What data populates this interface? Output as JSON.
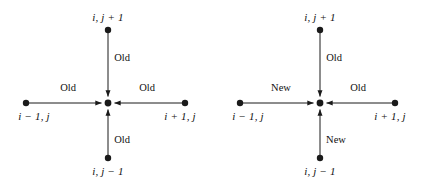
{
  "figure": {
    "background_color": "#ffffff",
    "line_color": "#1a1a1a",
    "text_color": "#111111",
    "node_radius": 3.2,
    "stencils": [
      {
        "id": "left-stencil",
        "name": "jacobi-stencil",
        "center": {
          "x": 108,
          "y": 103
        },
        "nodes": [
          {
            "id": "north",
            "name": "node-north",
            "label": "i, j + 1",
            "x": 108,
            "y": 30,
            "label_x": 108,
            "label_y": 11
          },
          {
            "id": "south",
            "name": "node-south",
            "label": "i, j − 1",
            "x": 108,
            "y": 158,
            "label_x": 108,
            "label_y": 165
          },
          {
            "id": "west",
            "name": "node-west",
            "label": "i − 1, j",
            "x": 26,
            "y": 103,
            "label_x": 34,
            "label_y": 110
          },
          {
            "id": "east",
            "name": "node-east",
            "label": "i + 1, j",
            "x": 185,
            "y": 103,
            "label_x": 180,
            "label_y": 110
          }
        ],
        "edges": [
          {
            "id": "north-edge",
            "name": "edge-north",
            "label": "Old",
            "label_x": 122,
            "label_y": 52
          },
          {
            "id": "south-edge",
            "name": "edge-south",
            "label": "Old",
            "label_x": 122,
            "label_y": 134
          },
          {
            "id": "west-edge",
            "name": "edge-west",
            "label": "Old",
            "label_x": 68,
            "label_y": 82
          },
          {
            "id": "east-edge",
            "name": "edge-east",
            "label": "Old",
            "label_x": 147,
            "label_y": 82
          }
        ]
      },
      {
        "id": "right-stencil",
        "name": "gauss-seidel-stencil",
        "center": {
          "x": 320,
          "y": 103
        },
        "nodes": [
          {
            "id": "north",
            "name": "node-north",
            "label": "i, j + 1",
            "x": 320,
            "y": 30,
            "label_x": 320,
            "label_y": 11
          },
          {
            "id": "south",
            "name": "node-south",
            "label": "i, j − 1",
            "x": 320,
            "y": 158,
            "label_x": 320,
            "label_y": 165
          },
          {
            "id": "west",
            "name": "node-west",
            "label": "i − 1, j",
            "x": 240,
            "y": 103,
            "label_x": 248,
            "label_y": 110
          },
          {
            "id": "east",
            "name": "node-east",
            "label": "i + 1, j",
            "x": 395,
            "y": 103,
            "label_x": 390,
            "label_y": 110
          }
        ],
        "edges": [
          {
            "id": "north-edge",
            "name": "edge-north",
            "label": "Old",
            "label_x": 334,
            "label_y": 52
          },
          {
            "id": "south-edge",
            "name": "edge-south",
            "label": "New",
            "label_x": 336,
            "label_y": 134
          },
          {
            "id": "west-edge",
            "name": "edge-west",
            "label": "New",
            "label_x": 281,
            "label_y": 82
          },
          {
            "id": "east-edge",
            "name": "edge-east",
            "label": "Old",
            "label_x": 358,
            "label_y": 82
          }
        ]
      }
    ]
  }
}
